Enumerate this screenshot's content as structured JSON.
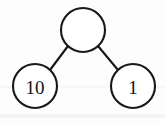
{
  "diagram": {
    "type": "number-bond",
    "background_color": "#fdfdfd",
    "stroke_color": "#181818",
    "fill_color": "#ffffff",
    "text_color": "#121212",
    "nodes": [
      {
        "id": "whole",
        "role": "whole",
        "label": "",
        "filled": false,
        "cx": 83,
        "cy": 30,
        "r": 22
      },
      {
        "id": "part-left",
        "role": "part",
        "label": "10",
        "filled": true,
        "cx": 35,
        "cy": 86,
        "r": 22
      },
      {
        "id": "part-right",
        "role": "part",
        "label": "1",
        "filled": true,
        "cx": 133,
        "cy": 86,
        "r": 22
      }
    ],
    "edges": [
      {
        "id": "edge-left",
        "from": "whole",
        "to": "part-left",
        "x1": 68,
        "y1": 46,
        "x2": 50,
        "y2": 70
      },
      {
        "id": "edge-right",
        "from": "whole",
        "to": "part-right",
        "x1": 98,
        "y1": 46,
        "x2": 118,
        "y2": 70
      }
    ]
  }
}
